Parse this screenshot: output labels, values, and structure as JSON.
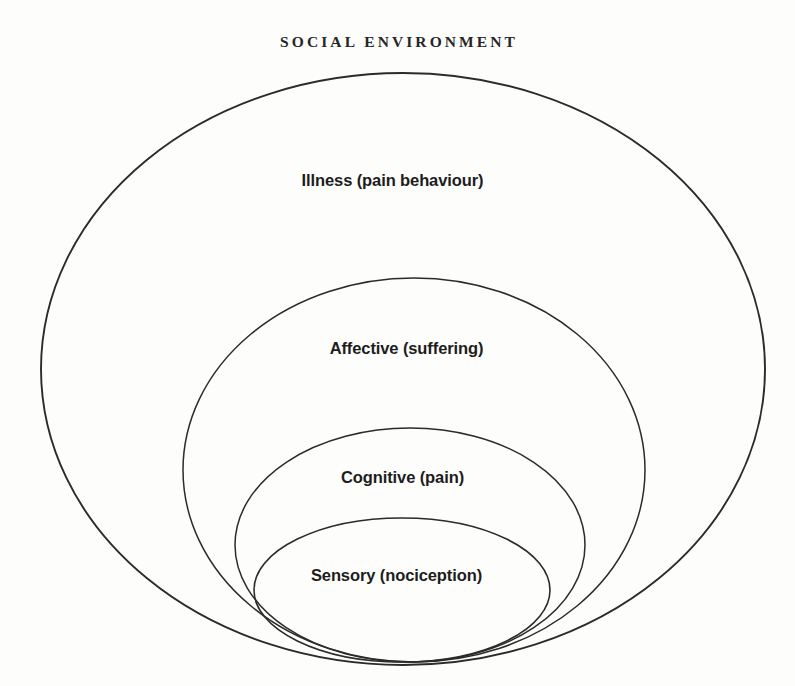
{
  "figure": {
    "title": "SOCIAL ENVIRONMENT",
    "background_color": "#fdfdfc",
    "stroke_color": "#2b2b2b",
    "text_color": "#1d1d1d"
  },
  "rings": [
    {
      "id": "illness",
      "label": "Illness (pain behaviour)",
      "level": 1,
      "cx": 403,
      "cy": 369,
      "rx": 362,
      "ry": 296,
      "stroke_width": 1.9
    },
    {
      "id": "affective",
      "label": "Affective (suffering)",
      "level": 2,
      "cx": 414,
      "cy": 470,
      "rx": 231,
      "ry": 192,
      "stroke_width": 1.5
    },
    {
      "id": "cognitive",
      "label": "Cognitive (pain)",
      "level": 3,
      "cx": 410,
      "cy": 545,
      "rx": 175,
      "ry": 117,
      "stroke_width": 1.5
    },
    {
      "id": "sensory",
      "label": "Sensory (nociception)",
      "level": 4,
      "cx": 402,
      "cy": 590,
      "rx": 148,
      "ry": 72,
      "stroke_width": 1.6
    }
  ]
}
